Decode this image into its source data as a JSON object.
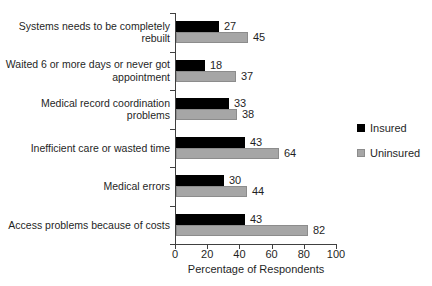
{
  "chart_data": {
    "type": "bar",
    "orientation": "horizontal",
    "title": "",
    "xlabel": "Percentage of Respondents",
    "ylabel": "",
    "xlim": [
      0,
      100
    ],
    "xticks": [
      0,
      20,
      40,
      60,
      80,
      100
    ],
    "grid": false,
    "data_labels": true,
    "legend_position": "right",
    "categories": [
      "Systems needs to be completely rebuilt",
      "Waited 6 or more days or never got appointment",
      "Medical record coordination problems",
      "Inefficient care or wasted time",
      "Medical errors",
      "Access problems because of costs"
    ],
    "category_label_lines": [
      [
        "Systems needs to be completely",
        "rebuilt"
      ],
      [
        "Waited 6 or more days or never got",
        "appointment"
      ],
      [
        "Medical record coordination",
        "problems"
      ],
      [
        "Inefficient care or wasted time"
      ],
      [
        "Medical errors"
      ],
      [
        "Access problems because of costs"
      ]
    ],
    "series": [
      {
        "name": "Insured",
        "color": "#000000",
        "border": "#000000",
        "values": [
          27,
          18,
          33,
          43,
          30,
          43
        ]
      },
      {
        "name": "Uninsured",
        "color": "#a6a6a6",
        "border": "#8c8c8c",
        "values": [
          45,
          37,
          38,
          64,
          44,
          82
        ]
      }
    ],
    "colors": {
      "axis": "#404040",
      "text": "#1f1f1f",
      "background": "#ffffff"
    }
  }
}
